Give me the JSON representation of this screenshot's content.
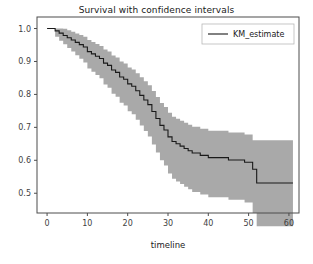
{
  "chart_data": {
    "type": "line",
    "title": "Survival with confidence intervals",
    "xlabel": "timeline",
    "ylabel": "",
    "xlim": [
      -2.5,
      62.5
    ],
    "ylim": [
      0.44,
      1.035
    ],
    "grid": false,
    "legend": {
      "position": "upper-right",
      "entries": [
        "KM_estimate"
      ]
    },
    "xticks": [
      0,
      10,
      20,
      30,
      40,
      50,
      60
    ],
    "xtick_labels": [
      "0",
      "10",
      "20",
      "30",
      "40",
      "50",
      "60"
    ],
    "yticks": [
      0.5,
      0.6,
      0.7,
      0.8,
      0.9,
      1.0
    ],
    "ytick_labels": [
      "0.5",
      "0.6",
      "0.7",
      "0.8",
      "0.9",
      "1.0"
    ],
    "colors": {
      "line": "#1a1a1a",
      "band": "#a9a9a9",
      "axes": "#4d4d4d",
      "background": "#ffffff"
    },
    "series": [
      {
        "name": "KM_estimate",
        "style": "step-post",
        "x": [
          0,
          1,
          2,
          3,
          4,
          5,
          6,
          7,
          8,
          9,
          10,
          11,
          12,
          13,
          14,
          15,
          16,
          17,
          18,
          19,
          20,
          21,
          22,
          23,
          24,
          25,
          26,
          27,
          28,
          29,
          30,
          31,
          32,
          33,
          34,
          35,
          36,
          37,
          38,
          39,
          40,
          41,
          42,
          43,
          44,
          45,
          46,
          47,
          48,
          49,
          50,
          51,
          52,
          53,
          61
        ],
        "values": [
          1.0,
          1.0,
          0.993,
          0.986,
          0.979,
          0.972,
          0.965,
          0.958,
          0.951,
          0.944,
          0.93,
          0.923,
          0.916,
          0.909,
          0.895,
          0.888,
          0.874,
          0.867,
          0.853,
          0.846,
          0.832,
          0.825,
          0.811,
          0.797,
          0.783,
          0.769,
          0.748,
          0.727,
          0.706,
          0.692,
          0.671,
          0.657,
          0.65,
          0.643,
          0.636,
          0.629,
          0.622,
          0.622,
          0.615,
          0.615,
          0.608,
          0.608,
          0.608,
          0.608,
          0.608,
          0.601,
          0.601,
          0.601,
          0.601,
          0.594,
          0.594,
          0.573,
          0.531,
          0.531,
          0.531
        ]
      }
    ],
    "confidence_band": {
      "name": "KM_estimate 95% CI",
      "upper": [
        1.0,
        1.0,
        1.0,
        1.0,
        0.999,
        0.995,
        0.99,
        0.985,
        0.98,
        0.975,
        0.965,
        0.959,
        0.953,
        0.947,
        0.936,
        0.93,
        0.918,
        0.912,
        0.9,
        0.894,
        0.882,
        0.876,
        0.864,
        0.852,
        0.84,
        0.828,
        0.81,
        0.792,
        0.774,
        0.762,
        0.744,
        0.732,
        0.726,
        0.72,
        0.714,
        0.708,
        0.702,
        0.702,
        0.696,
        0.696,
        0.69,
        0.69,
        0.69,
        0.69,
        0.69,
        0.684,
        0.684,
        0.684,
        0.684,
        0.678,
        0.678,
        0.661,
        0.661,
        0.661,
        0.661
      ],
      "lower": [
        1.0,
        1.0,
        0.975,
        0.963,
        0.952,
        0.941,
        0.93,
        0.919,
        0.908,
        0.897,
        0.879,
        0.869,
        0.859,
        0.849,
        0.83,
        0.82,
        0.802,
        0.793,
        0.775,
        0.766,
        0.749,
        0.74,
        0.723,
        0.706,
        0.689,
        0.672,
        0.648,
        0.624,
        0.6,
        0.584,
        0.56,
        0.544,
        0.536,
        0.528,
        0.52,
        0.512,
        0.504,
        0.504,
        0.496,
        0.496,
        0.488,
        0.488,
        0.488,
        0.488,
        0.488,
        0.48,
        0.48,
        0.48,
        0.48,
        0.472,
        0.472,
        0.44,
        0.4,
        0.4,
        0.4
      ]
    }
  }
}
